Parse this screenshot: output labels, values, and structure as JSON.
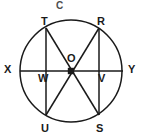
{
  "figure": {
    "type": "circle-geometry-diagram",
    "canvas": {
      "width": 143,
      "height": 140
    },
    "background_color": "#ffffff",
    "stroke_color": "#1a1a1a",
    "label_color": "#1a1a1a",
    "circle": {
      "cx": 71,
      "cy": 71,
      "r": 51
    },
    "center_point": {
      "name": "O",
      "cx": 71,
      "cy": 71,
      "marker": "filled-square"
    },
    "labels": {
      "C": "C",
      "T": "T",
      "R": "R",
      "X": "X",
      "Y": "Y",
      "W": "W",
      "V": "V",
      "O": "O",
      "U": "U",
      "S": "S"
    },
    "points": [
      {
        "name": "C",
        "x": 60,
        "y": 8,
        "note": "label above circle"
      },
      {
        "name": "T",
        "x": 46,
        "y": 28,
        "note": "upper-left point on circle"
      },
      {
        "name": "R",
        "x": 99,
        "y": 28,
        "note": "upper-right point on circle"
      },
      {
        "name": "X",
        "x": 20,
        "y": 71,
        "note": "left end of horizontal diameter"
      },
      {
        "name": "Y",
        "x": 123,
        "y": 71,
        "note": "right end of horizontal diameter"
      },
      {
        "name": "W",
        "x": 46,
        "y": 71,
        "note": "intersection of chord TU with diameter XY"
      },
      {
        "name": "V",
        "x": 99,
        "y": 71,
        "note": "intersection of chord RS with diameter XY"
      },
      {
        "name": "O",
        "x": 71,
        "y": 71,
        "note": "center of circle"
      },
      {
        "name": "U",
        "x": 46,
        "y": 115,
        "note": "lower-left point on circle"
      },
      {
        "name": "S",
        "x": 99,
        "y": 115,
        "note": "lower-right point on circle"
      }
    ],
    "segments": [
      {
        "name": "diameter-XY",
        "from": "X",
        "to": "Y",
        "x1": 20,
        "y1": 71,
        "x2": 123,
        "y2": 71
      },
      {
        "name": "chord-TU",
        "from": "T",
        "to": "U",
        "x1": 46,
        "y1": 28,
        "x2": 46,
        "y2": 115
      },
      {
        "name": "chord-RS",
        "from": "R",
        "to": "S",
        "x1": 99,
        "y1": 28,
        "x2": 99,
        "y2": 115
      },
      {
        "name": "diagonal-TS",
        "from": "T",
        "to": "S",
        "x1": 46,
        "y1": 28,
        "x2": 99,
        "y2": 115
      },
      {
        "name": "diagonal-RU",
        "from": "R",
        "to": "U",
        "x1": 99,
        "y1": 28,
        "x2": 46,
        "y2": 115
      }
    ]
  }
}
